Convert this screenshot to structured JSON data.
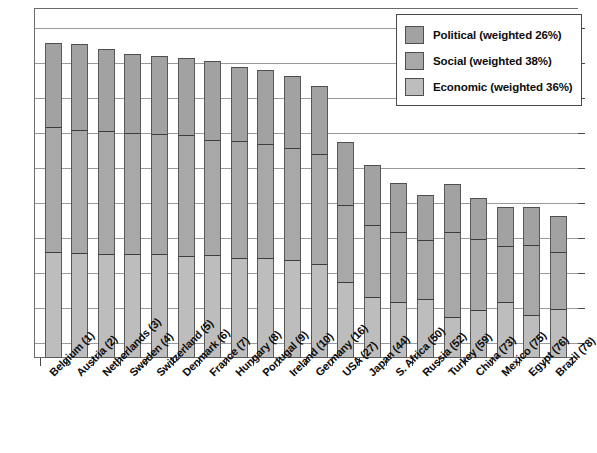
{
  "chart_data": {
    "type": "bar",
    "subtype": "stacked-column",
    "title": "",
    "xlabel": "",
    "ylabel": "",
    "ylim": [
      0,
      100
    ],
    "grid": true,
    "legend_position": "top-right",
    "categories": [
      "Belgium (1)",
      "Austria (2)",
      "Netherlands (3)",
      "Sweden (4)",
      "Switzerland (5)",
      "Denmark (6)",
      "France (7)",
      "Hungary (8)",
      "Portugal (9)",
      "Ireland (10)",
      "Germany (16)",
      "USA (27)",
      "Japan (44)",
      "S. Africa (50)",
      "Russia (52)",
      "Turkey (59)",
      "China (73)",
      "Mexico (75)",
      "Egypt (76)",
      "Brazil (78)"
    ],
    "series": [
      {
        "name": "Political (weighted 26%)",
        "color": "#a2a2a2",
        "values": [
          25.4,
          26.0,
          24.9,
          23.7,
          23.4,
          23.4,
          24.0,
          22.6,
          22.3,
          21.7,
          20.6,
          19.1,
          18.3,
          14.9,
          13.7,
          14.3,
          12.6,
          11.7,
          11.7,
          10.9
        ]
      },
      {
        "name": "Social (weighted 38%)",
        "color": "#a8a8a8",
        "values": [
          38.0,
          37.4,
          37.4,
          36.9,
          36.6,
          36.6,
          34.9,
          35.4,
          34.6,
          34.0,
          33.1,
          23.4,
          21.7,
          21.1,
          17.7,
          26.0,
          21.4,
          16.9,
          21.1,
          17.1
        ]
      },
      {
        "name": "Economic (weighted 36%)",
        "color": "#bdbdbd",
        "values": [
          32.0,
          31.7,
          31.4,
          31.4,
          31.4,
          30.9,
          31.1,
          30.3,
          30.3,
          29.7,
          28.6,
          22.9,
          18.6,
          17.1,
          18.0,
          12.3,
          14.6,
          17.1,
          13.1,
          14.9
        ]
      }
    ],
    "totals": [
      95.4,
      95.1,
      93.7,
      92.0,
      91.4,
      90.9,
      90.0,
      88.3,
      87.2,
      85.4,
      82.3,
      65.4,
      58.6,
      53.1,
      49.4,
      52.6,
      48.6,
      45.7,
      45.9,
      42.9
    ],
    "y_gridline_count": 10
  },
  "legend": {
    "items": [
      {
        "label": "Political (weighted 26%)",
        "color": "#a2a2a2"
      },
      {
        "label": "Social (weighted 38%)",
        "color": "#a8a8a8"
      },
      {
        "label": "Economic (weighted 36%)",
        "color": "#bdbdbd"
      }
    ]
  }
}
